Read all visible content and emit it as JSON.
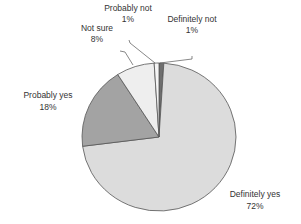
{
  "chart_data": {
    "type": "pie",
    "title": "",
    "start": "top",
    "direction": "clockwise",
    "slices": [
      {
        "label": "Definitely not",
        "value": 1,
        "pct_label": "1%",
        "color": "#6e6e6e"
      },
      {
        "label": "Definitely yes",
        "value": 72,
        "pct_label": "72%",
        "color": "#dcdcdc"
      },
      {
        "label": "Probably yes",
        "value": 18,
        "pct_label": "18%",
        "color": "#a3a3a3"
      },
      {
        "label": "Not sure",
        "value": 8,
        "pct_label": "8%",
        "color": "#eeeeee"
      },
      {
        "label": "Probably not",
        "value": 1,
        "pct_label": "1%",
        "color": "#f5f5f5"
      }
    ],
    "legend": "none",
    "data_labels": "outside with leader lines"
  }
}
